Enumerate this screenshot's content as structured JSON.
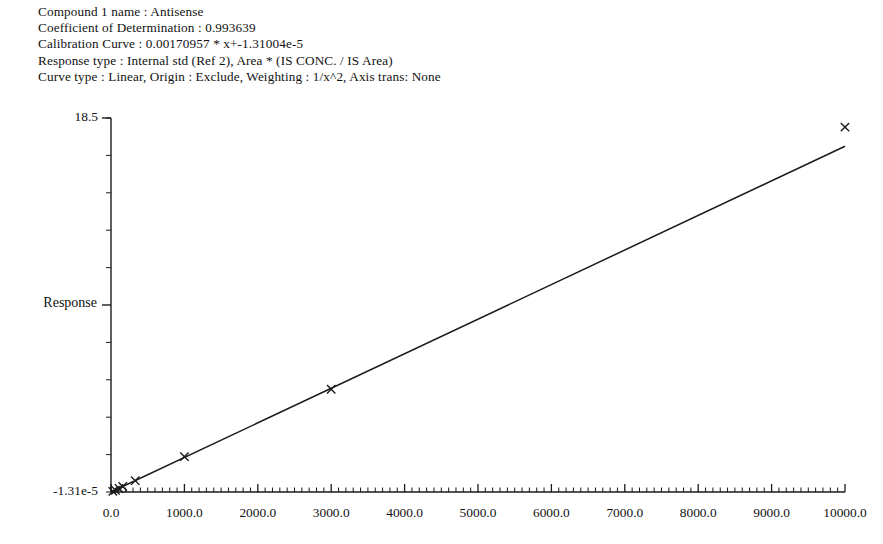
{
  "header": {
    "lines": [
      "Compound 1 name : Antisense",
      "Coefficient of Determination : 0.993639",
      "Calibration Curve : 0.00170957 * x+-1.31004e-5",
      "Response type : Internal std (Ref 2), Area * (IS CONC. / IS Area)",
      "Curve type : Linear, Origin : Exclude, Weighting : 1/x^2, Axis trans: None"
    ]
  },
  "chart_data": {
    "type": "scatter",
    "title": "",
    "xlabel": "",
    "ylabel": "Response",
    "xlim": [
      0,
      10000
    ],
    "ylim": [
      -1.31004e-05,
      18.5
    ],
    "ylim_labels": [
      "-1.31e-5",
      "18.5"
    ],
    "grid": false,
    "legend": null,
    "x_tick_labels": [
      "0.0",
      "1000.0",
      "2000.0",
      "3000.0",
      "4000.0",
      "5000.0",
      "6000.0",
      "7000.0",
      "8000.0",
      "9000.0",
      "10000.0"
    ],
    "x_tick_values": [
      0,
      1000,
      2000,
      3000,
      4000,
      5000,
      6000,
      7000,
      8000,
      9000,
      10000
    ],
    "x_minor_tick_step": 100,
    "y_minor_tick_count": 10,
    "marker": "x",
    "series": [
      {
        "name": "Calibration standards",
        "points": [
          {
            "x": 25,
            "y": 0.03
          },
          {
            "x": 60,
            "y": 0.09
          },
          {
            "x": 110,
            "y": 0.17
          },
          {
            "x": 160,
            "y": 0.27
          },
          {
            "x": 330,
            "y": 0.56
          },
          {
            "x": 1000,
            "y": 1.75
          },
          {
            "x": 3000,
            "y": 5.08
          },
          {
            "x": 10000,
            "y": 18.05
          }
        ]
      }
    ],
    "fit_line": {
      "name": "Calibration Curve",
      "equation": "0.00170957 * x+-1.31004e-5",
      "slope": 0.00170957,
      "intercept": -1.31004e-05,
      "r_squared": 0.993639,
      "x_start": 0,
      "x_end": 10000,
      "y_start": 0.0,
      "y_end": 17.1
    }
  }
}
